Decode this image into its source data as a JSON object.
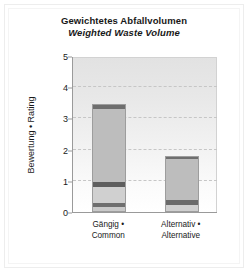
{
  "chart_data": {
    "type": "bar",
    "stacked": true,
    "title": "Gewichtetes Abfallvolumen",
    "subtitle": "Weighted Waste Volume",
    "xlabel": "",
    "ylabel": "Bewertung • Rating",
    "ylim": [
      0,
      5
    ],
    "yticks": [
      0,
      1,
      2,
      3,
      4,
      5
    ],
    "ytick_labels": [
      "0",
      "1",
      "2",
      "3",
      "4",
      "5"
    ],
    "grid": true,
    "grid_axis": "y",
    "legend": false,
    "categories": [
      "Gängig • Common",
      "Alternativ • Alternative"
    ],
    "category_lines": [
      [
        "Gängig •",
        "Common"
      ],
      [
        "Alternativ •",
        "Alternative"
      ]
    ],
    "totals": [
      3.46,
      1.79
    ],
    "bars": [
      {
        "category": "Gängig • Common",
        "total": 3.46,
        "segments": [
          {
            "name": "base-light",
            "from": 0.0,
            "to": 0.15,
            "color": "#c9c9c9"
          },
          {
            "name": "band-dark-1",
            "from": 0.15,
            "to": 0.3,
            "color": "#6e6e6e"
          },
          {
            "name": "mid-light",
            "from": 0.3,
            "to": 0.8,
            "color": "#d0d0d0"
          },
          {
            "name": "band-dark-2",
            "from": 0.8,
            "to": 0.96,
            "color": "#5e5e5e"
          },
          {
            "name": "body-light",
            "from": 0.96,
            "to": 3.3,
            "color": "#bdbdbd"
          },
          {
            "name": "cap-dark",
            "from": 3.3,
            "to": 3.46,
            "color": "#6e6e6e"
          }
        ]
      },
      {
        "category": "Alternativ • Alternative",
        "total": 1.79,
        "segments": [
          {
            "name": "base-light",
            "from": 0.0,
            "to": 0.22,
            "color": "#cfcfcf"
          },
          {
            "name": "band-dark-1",
            "from": 0.22,
            "to": 0.38,
            "color": "#6a6a6a"
          },
          {
            "name": "body-light",
            "from": 0.38,
            "to": 1.7,
            "color": "#bdbdbd"
          },
          {
            "name": "cap-dark",
            "from": 1.7,
            "to": 1.79,
            "color": "#6e6e6e"
          }
        ]
      }
    ],
    "colors": {
      "bar_light": "#bdbdbd",
      "bar_dark": "#6e6e6e",
      "axis": "#9a9a9a",
      "grid": "#c6c6c6",
      "text": "#1a1a1a",
      "plot_background": "#eeeeee",
      "figure_background": "#ffffff"
    }
  }
}
